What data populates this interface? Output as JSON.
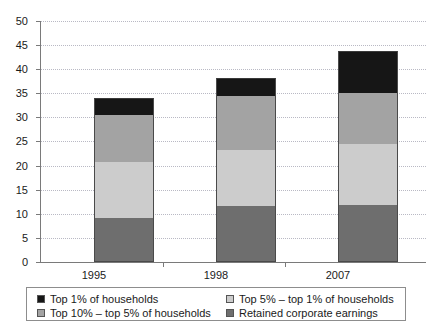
{
  "chart_data": {
    "type": "bar",
    "subtype": "stacked-bar",
    "title": "",
    "xlabel": "",
    "ylabel": "",
    "categories": [
      "1995",
      "1998",
      "2007"
    ],
    "ylim": [
      0,
      50
    ],
    "yticks": [
      0,
      5,
      10,
      15,
      20,
      25,
      30,
      35,
      40,
      45,
      50
    ],
    "ytick_labels": [
      "0",
      "5",
      "10",
      "15",
      "20",
      "25",
      "30",
      "35",
      "40",
      "45",
      "50"
    ],
    "grid": true,
    "grid_axis": "y",
    "grid_style": "dotted",
    "legend_position": "bottom",
    "stack_order_bottom_to_top": [
      "Retained corporate earnings",
      "Top 5% – top 1% of households",
      "Top 10% – top 5% of households",
      "Top 1% of households"
    ],
    "series": [
      {
        "name": "Retained corporate earnings",
        "color": "#6e6e6e",
        "values": [
          9.1,
          11.7,
          11.9
        ]
      },
      {
        "name": "Top 5% – top 1% of households",
        "color": "#cccccc",
        "values": [
          11.6,
          11.6,
          12.5
        ]
      },
      {
        "name": "Top 10% – top 5% of households",
        "color": "#a3a3a3",
        "values": [
          9.8,
          11.2,
          10.6
        ]
      },
      {
        "name": "Top 1% of households",
        "color": "#161616",
        "values": [
          3.5,
          3.7,
          8.7
        ]
      }
    ],
    "totals": [
      34.0,
      38.2,
      43.7
    ],
    "cumulative_boundaries": {
      "1995": [
        9.1,
        20.7,
        30.5,
        34.0
      ],
      "1998": [
        11.7,
        23.3,
        34.5,
        38.2
      ],
      "2007": [
        11.9,
        24.4,
        35.0,
        43.7
      ]
    }
  },
  "legend": {
    "items": [
      {
        "label": "Top 1% of households",
        "color": "#161616"
      },
      {
        "label": "Top 5% – top 1% of households",
        "color": "#cccccc"
      },
      {
        "label": "Top 10% – top 5% of households",
        "color": "#a3a3a3"
      },
      {
        "label": "Retained corporate earnings",
        "color": "#6e6e6e"
      }
    ]
  },
  "axis": {
    "y_labels": [
      "50",
      "45",
      "40",
      "35",
      "30",
      "25",
      "20",
      "15",
      "10",
      "5",
      "0"
    ],
    "x_labels": [
      "1995",
      "1998",
      "2007"
    ]
  }
}
